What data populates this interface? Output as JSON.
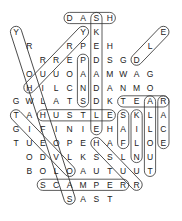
{
  "puzzle": {
    "type": "word-search",
    "grid_rows": [
      {
        "row": 0,
        "cells": [
          {
            "c": 4,
            "l": "D"
          },
          {
            "c": 5,
            "l": "A"
          },
          {
            "c": 6,
            "l": "S"
          },
          {
            "c": 7,
            "l": "H"
          }
        ]
      },
      {
        "row": 1,
        "cells": [
          {
            "c": 0,
            "l": "Y"
          },
          {
            "c": 5,
            "l": "Y"
          },
          {
            "c": 6,
            "l": "K"
          },
          {
            "c": 11,
            "l": "E"
          }
        ]
      },
      {
        "row": 2,
        "cells": [
          {
            "c": 1,
            "l": "R"
          },
          {
            "c": 4,
            "l": "R"
          },
          {
            "c": 5,
            "l": "P"
          },
          {
            "c": 6,
            "l": "E"
          },
          {
            "c": 7,
            "l": "H"
          },
          {
            "c": 10,
            "l": "L"
          }
        ]
      },
      {
        "row": 3,
        "cells": [
          {
            "c": 2,
            "l": "R"
          },
          {
            "c": 3,
            "l": "R"
          },
          {
            "c": 4,
            "l": "E"
          },
          {
            "c": 5,
            "l": "P"
          },
          {
            "c": 6,
            "l": "D"
          },
          {
            "c": 7,
            "l": "S"
          },
          {
            "c": 8,
            "l": "G"
          },
          {
            "c": 9,
            "l": "D"
          }
        ]
      },
      {
        "row": 4,
        "cells": [
          {
            "c": 1,
            "l": "O"
          },
          {
            "c": 2,
            "l": "U"
          },
          {
            "c": 3,
            "l": "U"
          },
          {
            "c": 4,
            "l": "O"
          },
          {
            "c": 5,
            "l": "A"
          },
          {
            "c": 6,
            "l": "A"
          },
          {
            "c": 7,
            "l": "M"
          },
          {
            "c": 8,
            "l": "W"
          },
          {
            "c": 9,
            "l": "A"
          },
          {
            "c": 10,
            "l": "G"
          }
        ]
      },
      {
        "row": 5,
        "cells": [
          {
            "c": 1,
            "l": "H"
          },
          {
            "c": 2,
            "l": "I"
          },
          {
            "c": 3,
            "l": "L"
          },
          {
            "c": 4,
            "l": "C"
          },
          {
            "c": 5,
            "l": "N"
          },
          {
            "c": 6,
            "l": "D"
          },
          {
            "c": 7,
            "l": "A"
          },
          {
            "c": 8,
            "l": "N"
          },
          {
            "c": 9,
            "l": "M"
          },
          {
            "c": 10,
            "l": "O"
          }
        ]
      },
      {
        "row": 6,
        "cells": [
          {
            "c": 0,
            "l": "G"
          },
          {
            "c": 1,
            "l": "W"
          },
          {
            "c": 2,
            "l": "L"
          },
          {
            "c": 3,
            "l": "A"
          },
          {
            "c": 4,
            "l": "T"
          },
          {
            "c": 5,
            "l": "S"
          },
          {
            "c": 6,
            "l": "D"
          },
          {
            "c": 7,
            "l": "K"
          },
          {
            "c": 8,
            "l": "T"
          },
          {
            "c": 9,
            "l": "E"
          },
          {
            "c": 10,
            "l": "A"
          },
          {
            "c": 11,
            "l": "R"
          }
        ]
      },
      {
        "row": 7,
        "cells": [
          {
            "c": 0,
            "l": "T"
          },
          {
            "c": 1,
            "l": "A"
          },
          {
            "c": 2,
            "l": "H"
          },
          {
            "c": 3,
            "l": "U"
          },
          {
            "c": 4,
            "l": "S"
          },
          {
            "c": 5,
            "l": "T"
          },
          {
            "c": 6,
            "l": "L"
          },
          {
            "c": 7,
            "l": "E"
          },
          {
            "c": 8,
            "l": "S"
          },
          {
            "c": 9,
            "l": "K"
          },
          {
            "c": 10,
            "l": "L"
          },
          {
            "c": 11,
            "l": "A"
          }
        ]
      },
      {
        "row": 8,
        "cells": [
          {
            "c": 0,
            "l": "G"
          },
          {
            "c": 1,
            "l": "I"
          },
          {
            "c": 2,
            "l": "F"
          },
          {
            "c": 3,
            "l": "I"
          },
          {
            "c": 4,
            "l": "N"
          },
          {
            "c": 5,
            "l": "I"
          },
          {
            "c": 6,
            "l": "E"
          },
          {
            "c": 7,
            "l": "H"
          },
          {
            "c": 8,
            "l": "A"
          },
          {
            "c": 9,
            "l": "I"
          },
          {
            "c": 10,
            "l": "L"
          },
          {
            "c": 11,
            "l": "C"
          }
        ]
      },
      {
        "row": 9,
        "cells": [
          {
            "c": 0,
            "l": "T"
          },
          {
            "c": 1,
            "l": "U"
          },
          {
            "c": 2,
            "l": "E"
          },
          {
            "c": 3,
            "l": "O"
          },
          {
            "c": 4,
            "l": "P"
          },
          {
            "c": 5,
            "l": "E"
          },
          {
            "c": 6,
            "l": "H"
          },
          {
            "c": 7,
            "l": "A"
          },
          {
            "c": 8,
            "l": "F"
          },
          {
            "c": 9,
            "l": "L"
          },
          {
            "c": 10,
            "l": "O"
          },
          {
            "c": 11,
            "l": "E"
          }
        ]
      },
      {
        "row": 10,
        "cells": [
          {
            "c": 1,
            "l": "O"
          },
          {
            "c": 2,
            "l": "D"
          },
          {
            "c": 3,
            "l": "V"
          },
          {
            "c": 4,
            "l": "L"
          },
          {
            "c": 5,
            "l": "K"
          },
          {
            "c": 6,
            "l": "S"
          },
          {
            "c": 7,
            "l": "S"
          },
          {
            "c": 8,
            "l": "L"
          },
          {
            "c": 9,
            "l": "N"
          },
          {
            "c": 10,
            "l": "U"
          }
        ]
      },
      {
        "row": 11,
        "cells": [
          {
            "c": 1,
            "l": "B"
          },
          {
            "c": 2,
            "l": "O"
          },
          {
            "c": 3,
            "l": "L"
          },
          {
            "c": 4,
            "l": "O"
          },
          {
            "c": 5,
            "l": "A"
          },
          {
            "c": 6,
            "l": "U"
          },
          {
            "c": 7,
            "l": "T"
          },
          {
            "c": 8,
            "l": "U"
          },
          {
            "c": 9,
            "l": "U"
          },
          {
            "c": 10,
            "l": "T"
          }
        ]
      },
      {
        "row": 12,
        "cells": [
          {
            "c": 2,
            "l": "S"
          },
          {
            "c": 3,
            "l": "C"
          },
          {
            "c": 4,
            "l": "A"
          },
          {
            "c": 5,
            "l": "M"
          },
          {
            "c": 6,
            "l": "P"
          },
          {
            "c": 7,
            "l": "E"
          },
          {
            "c": 8,
            "l": "R"
          },
          {
            "c": 9,
            "l": "R"
          }
        ]
      },
      {
        "row": 13,
        "cells": [
          {
            "c": 4,
            "l": "S"
          },
          {
            "c": 5,
            "l": "A"
          },
          {
            "c": 6,
            "l": "S"
          },
          {
            "c": 7,
            "l": "T"
          }
        ]
      }
    ],
    "found_words": [
      {
        "word": "DASH",
        "from": [
          0,
          4
        ],
        "to": [
          0,
          7
        ]
      },
      {
        "word": "SKEDADDLE",
        "from": [
          0,
          6
        ],
        "to": [
          8,
          6
        ]
      },
      {
        "word": "HURRY",
        "from": [
          5,
          1
        ],
        "to": [
          1,
          5
        ]
      },
      {
        "word": "TEAR",
        "from": [
          6,
          8
        ],
        "to": [
          6,
          11
        ]
      },
      {
        "word": "RACE",
        "from": [
          6,
          11
        ],
        "to": [
          9,
          11
        ]
      },
      {
        "word": "HUSTLE",
        "from": [
          7,
          2
        ],
        "to": [
          7,
          7
        ]
      },
      {
        "word": "SCAMPER",
        "from": [
          12,
          2
        ],
        "to": [
          12,
          8
        ]
      },
      {
        "word": "ALLOUT",
        "from": [
          6,
          10
        ],
        "to": [
          11,
          10
        ]
      },
      {
        "word": "KILN",
        "from": [
          7,
          9
        ],
        "to": [
          10,
          9
        ]
      },
      {
        "word": "SAF",
        "from": [
          7,
          8
        ],
        "to": [
          9,
          8
        ]
      },
      {
        "word": "PANS",
        "from": [
          3,
          5
        ],
        "to": [
          6,
          5
        ]
      },
      {
        "word": "HASTEN",
        "from": [
          9,
          6
        ],
        "to": [
          12,
          9
        ]
      },
      {
        "word": "DLE",
        "from": [
          3,
          9
        ],
        "to": [
          1,
          11
        ]
      },
      {
        "word": "YRRUC",
        "from": [
          1,
          0
        ],
        "to": [
          13,
          4
        ]
      },
      {
        "word": "TAGWHOB",
        "from": [
          7,
          0
        ],
        "to": [
          11,
          4
        ]
      }
    ]
  },
  "colors": {
    "ink": "#222222",
    "outline": "#333333",
    "background": "#ffffff"
  }
}
